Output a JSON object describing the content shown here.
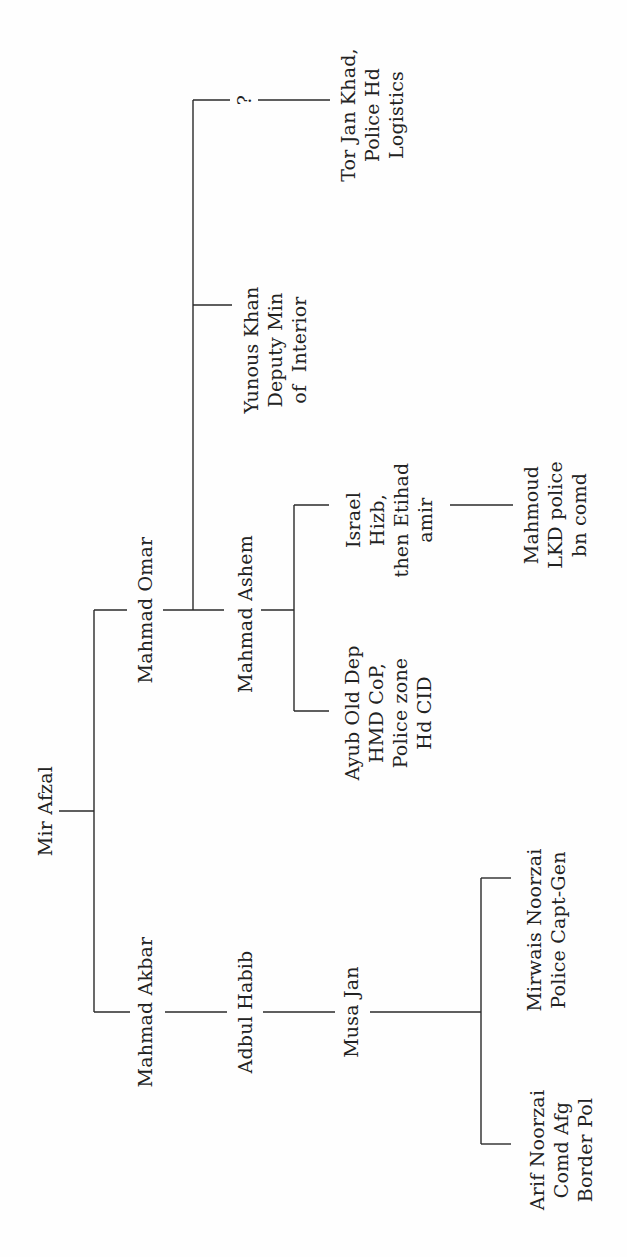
{
  "diagram": {
    "type": "family-tree",
    "orientation": "rotated-90-ccw",
    "line_color": "#2a2a2a",
    "text_color": "#222222",
    "nodes": {
      "mir_afzal": {
        "label": "Mir Afzal"
      },
      "mahmad_akbar": {
        "label": "Mahmad Akbar"
      },
      "adbul_habib": {
        "label": "Adbul Habib"
      },
      "musa_jan": {
        "label": "Musa Jan"
      },
      "arif_noorzai": {
        "label": "Arif Noorzai\nComd Afg\nBorder Pol"
      },
      "mirwais_noorzai": {
        "label": "Mirwais Noorzai\nPolice Capt-Gen"
      },
      "mahmad_omar": {
        "label": "Mahmad Omar"
      },
      "mahmad_ashem": {
        "label": "Mahmad Ashem"
      },
      "ayub": {
        "label": "Ayub Old Dep\nHMD CoP,\nPolice zone\nHd CID"
      },
      "israel": {
        "label": "Israel\nHizb,\nthen Etihad\namir"
      },
      "mahmoud": {
        "label": "Mahmoud\nLKD police\nbn comd"
      },
      "yunous_khan": {
        "label": "Yunous Khan\nDeputy Min\nof  Interior"
      },
      "unknown": {
        "label": "?"
      },
      "tor_jan_khad": {
        "label": "Tor Jan Khad,\nPolice Hd\nLogistics"
      }
    },
    "edges": [
      [
        "Mir Afzal",
        "Mahmad Akbar"
      ],
      [
        "Mir Afzal",
        "Mahmad Omar"
      ],
      [
        "Mahmad Akbar",
        "Adbul Habib"
      ],
      [
        "Adbul Habib",
        "Musa Jan"
      ],
      [
        "Musa Jan",
        "Arif Noorzai"
      ],
      [
        "Musa Jan",
        "Mirwais Noorzai"
      ],
      [
        "Mahmad Omar",
        "Mahmad Ashem"
      ],
      [
        "Mahmad Omar",
        "Yunous Khan"
      ],
      [
        "Mahmad Omar",
        "?"
      ],
      [
        "?",
        "Tor Jan Khad"
      ],
      [
        "Mahmad Ashem",
        "Ayub"
      ],
      [
        "Mahmad Ashem",
        "Israel"
      ],
      [
        "Israel",
        "Mahmoud"
      ]
    ]
  }
}
